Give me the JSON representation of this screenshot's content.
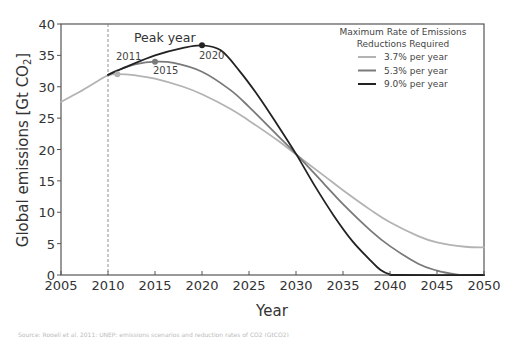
{
  "chart_data": {
    "type": "line",
    "title": "",
    "xlabel": "Year",
    "ylabel": "Global emissions [Gt CO2]",
    "xlim": [
      2005,
      2050
    ],
    "ylim": [
      0,
      40
    ],
    "xticks": [
      2005,
      2010,
      2015,
      2020,
      2025,
      2030,
      2035,
      2040,
      2045,
      2050
    ],
    "yticks": [
      0,
      5,
      10,
      15,
      20,
      25,
      30,
      35,
      40
    ],
    "grid": false,
    "legend_position": "upper right",
    "legend_title": "Maximum Rate of Emissions Reductions Required",
    "reference_line": {
      "x": 2010,
      "style": "dashed"
    },
    "annotations": [
      {
        "text": "Peak year",
        "x": 2015.5,
        "y": 37.5
      },
      {
        "text": "2011",
        "x": 2011,
        "y": 32.0
      },
      {
        "text": "2015",
        "x": 2015,
        "y": 34.0
      },
      {
        "text": "2020",
        "x": 2020,
        "y": 36.6
      }
    ],
    "series": [
      {
        "name": "3.7% per year",
        "color": "#b3b3b3",
        "peak": {
          "year": 2011,
          "value": 32.0
        },
        "x": [
          2005,
          2007,
          2009,
          2010,
          2011,
          2013,
          2015,
          2018,
          2020,
          2023,
          2025,
          2028,
          2030,
          2033,
          2035,
          2038,
          2040,
          2043,
          2045,
          2048,
          2050
        ],
        "values": [
          27.6,
          29.2,
          31.0,
          31.8,
          32.0,
          31.8,
          31.3,
          30.0,
          28.8,
          26.5,
          24.6,
          21.5,
          19.2,
          15.8,
          13.5,
          10.3,
          8.4,
          6.2,
          5.2,
          4.5,
          4.4
        ]
      },
      {
        "name": "5.3% per year",
        "color": "#7a7a7a",
        "peak": {
          "year": 2015,
          "value": 34.0
        },
        "x": [
          2010,
          2011,
          2013,
          2015,
          2017,
          2020,
          2023,
          2025,
          2028,
          2030,
          2033,
          2035,
          2038,
          2040,
          2043,
          2045,
          2047,
          2048,
          2050
        ],
        "values": [
          31.9,
          32.6,
          33.6,
          34.0,
          33.8,
          32.4,
          29.5,
          26.8,
          22.3,
          19.3,
          14.5,
          11.3,
          7.0,
          4.6,
          1.8,
          0.7,
          0.1,
          0.0,
          0.0
        ]
      },
      {
        "name": "9.0% per year",
        "color": "#222222",
        "peak": {
          "year": 2020,
          "value": 36.6
        },
        "x": [
          2010,
          2012,
          2015,
          2018,
          2020,
          2022,
          2024,
          2026,
          2028,
          2030,
          2032,
          2034,
          2036,
          2038,
          2039,
          2040,
          2041,
          2050
        ],
        "values": [
          31.9,
          33.2,
          35.0,
          36.2,
          36.6,
          35.8,
          32.5,
          28.5,
          24.0,
          19.3,
          14.2,
          9.5,
          5.4,
          2.2,
          0.8,
          0.1,
          0.0,
          0.0
        ]
      }
    ]
  },
  "caption_text": "Source: Rogelj et al. 2011; UNEP; emissions scenarios and reduction rates of CO2 (GtCO2)"
}
